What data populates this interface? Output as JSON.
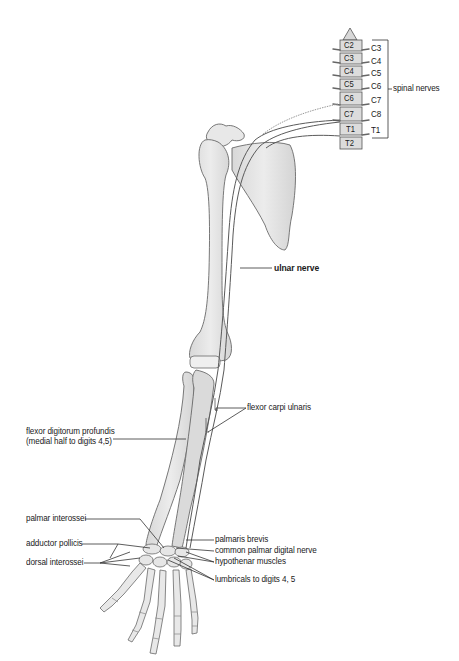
{
  "diagram": {
    "vertebrae": [
      "C2",
      "C3",
      "C4",
      "C5",
      "C6",
      "C7",
      "T1",
      "T2"
    ],
    "spinal_nerve_labels": [
      "C3",
      "C4",
      "C5",
      "C6",
      "C7",
      "C8",
      "T1"
    ],
    "bracket_label": "spinal nerves",
    "labels": {
      "ulnar_nerve": "ulnar nerve",
      "flexor_carpi_ulnaris": "flexor carpi ulnaris",
      "flexor_digitorum_line1": "flexor digitorum profundis",
      "flexor_digitorum_line2": "(medial half to digits 4,5)",
      "palmar_interossei": "palmar interossei",
      "adductor_pollicis": "adductor pollicis",
      "dorsal_interossei": "dorsal interossei",
      "palmaris_brevis": "palmaris brevis",
      "common_palmar_digital_nerve": "common palmar digital nerve",
      "hypothenar_muscles": "hypothenar muscles",
      "lumbricals": "lumbricals to digits 4, 5"
    },
    "colors": {
      "bone_fill": "#e4e4e4",
      "bone_stroke": "#6a6a6a",
      "nerve_stroke": "#5a5a5a",
      "leader_line": "#333333",
      "text": "#1a1a1a"
    }
  }
}
